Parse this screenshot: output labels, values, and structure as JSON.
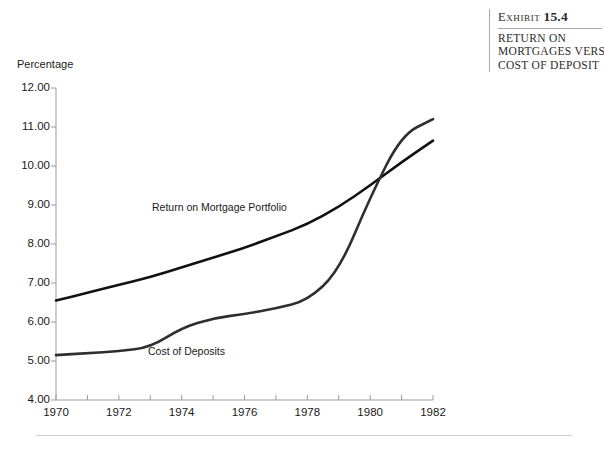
{
  "exhibit": {
    "label": "Exhibit",
    "number": "15.4",
    "title_lines": [
      "Return on",
      "Mortgages versus",
      "Cost of Deposit"
    ]
  },
  "footer": {
    "rule_color": "#cfcfcf"
  },
  "chart_data": {
    "type": "line",
    "title": "",
    "xlabel": "",
    "ylabel": "Percentage",
    "xlim": [
      1970,
      1982
    ],
    "ylim": [
      4.0,
      12.0
    ],
    "grid": false,
    "legend": "inline-labels",
    "x_tick_labels": [
      "1970",
      "1972",
      "1974",
      "1976",
      "1978",
      "1980",
      "1982"
    ],
    "x_tick_values": [
      1970,
      1972,
      1974,
      1976,
      1978,
      1980,
      1982
    ],
    "x_minor_ticks": [
      1970,
      1971,
      1972,
      1973,
      1974,
      1975,
      1976,
      1977,
      1978,
      1979,
      1980,
      1981,
      1982
    ],
    "y_tick_labels": [
      "12.00",
      "11.00",
      "10.00",
      "9.00",
      "8.00",
      "7.00",
      "6.00",
      "5.00",
      "4.00"
    ],
    "y_tick_values": [
      12.0,
      11.0,
      10.0,
      9.0,
      8.0,
      7.0,
      6.0,
      5.0,
      4.0
    ],
    "x": [
      1970,
      1971,
      1972,
      1973,
      1974,
      1975,
      1976,
      1977,
      1978,
      1979,
      1980,
      1981,
      1982
    ],
    "series": [
      {
        "name": "Return on Mortgage Portfolio",
        "color": "#111111",
        "width": 2.6,
        "values": [
          6.55,
          6.75,
          6.95,
          7.15,
          7.4,
          7.65,
          7.9,
          8.2,
          8.5,
          8.95,
          9.5,
          10.1,
          10.65
        ]
      },
      {
        "name": "Cost of Deposits",
        "color": "#2e2e2e",
        "width": 2.6,
        "values": [
          5.15,
          5.2,
          5.25,
          5.35,
          5.85,
          6.1,
          6.2,
          6.35,
          6.55,
          7.3,
          9.2,
          10.8,
          11.2
        ]
      }
    ],
    "annotations": [
      {
        "text": "Return on Mortgage Portfolio",
        "series": "Return on Mortgage Portfolio"
      },
      {
        "text": "Cost of Deposits",
        "series": "Cost of Deposits"
      }
    ]
  }
}
